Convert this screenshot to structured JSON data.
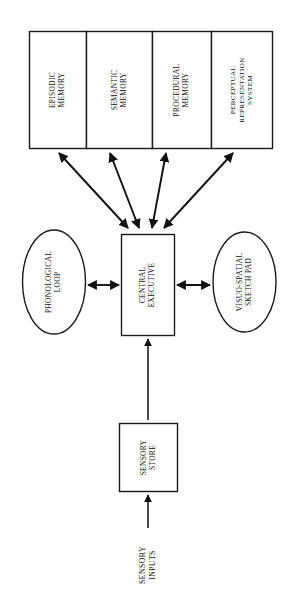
{
  "diagram": {
    "colors": {
      "stroke": "#111111",
      "fill": "#ffffff",
      "background": "#ffffff"
    },
    "long_term_memory_boxes": [
      {
        "id": "episodic-memory",
        "line1": "EPISODIC",
        "line2": "MEMORY",
        "line3": ""
      },
      {
        "id": "semantic-memory",
        "line1": "SEMANTIC",
        "line2": "MEMORY",
        "line3": ""
      },
      {
        "id": "procedural-memory",
        "line1": "PROCEDURAL",
        "line2": "MEMORY",
        "line3": ""
      },
      {
        "id": "perceptual-representation-system",
        "line1": "PERCEPTUAL",
        "line2": "REPRESENTATION",
        "line3": "SYSTEM"
      }
    ],
    "central_executive": {
      "id": "central-executive",
      "line1": "CENTRAL",
      "line2": "EXECUTIVE"
    },
    "phonological_loop": {
      "id": "phonological-loop",
      "line1": "PHONOLOGICAL",
      "line2": "LOOP"
    },
    "visuo_spatial_sketch_pad": {
      "id": "visuo-spatial-sketch-pad",
      "line1": "VISUO-SPATIAL",
      "line2": "SKETCH PAD"
    },
    "sensory_store": {
      "id": "sensory-store",
      "line1": "SENSORY",
      "line2": "STORE"
    },
    "sensory_inputs": {
      "id": "sensory-inputs",
      "line1": "SENSORY",
      "line2": "INPUTS"
    },
    "connectors": [
      {
        "id": "ltm-episodic-to-ce",
        "type": "double-arrow"
      },
      {
        "id": "ltm-semantic-to-ce",
        "type": "double-arrow"
      },
      {
        "id": "ltm-procedural-to-ce",
        "type": "double-arrow"
      },
      {
        "id": "ltm-prs-to-ce",
        "type": "double-arrow"
      },
      {
        "id": "phonological-loop-to-ce",
        "type": "double-arrow"
      },
      {
        "id": "ce-to-sketch-pad",
        "type": "double-arrow"
      },
      {
        "id": "sensory-store-to-ce",
        "type": "single-arrow"
      },
      {
        "id": "sensory-inputs-to-store",
        "type": "single-arrow"
      }
    ]
  }
}
